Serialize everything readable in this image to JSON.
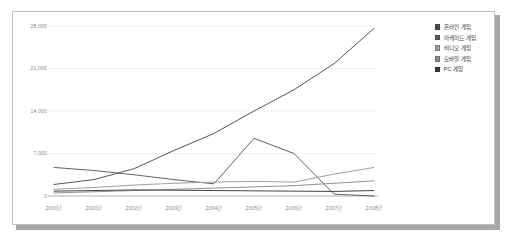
{
  "chart_data": {
    "type": "line",
    "title": "",
    "xlabel": "",
    "ylabel": "",
    "grid": true,
    "legend_position": "top-right",
    "categories": [
      "2000년",
      "2001년",
      "2002년",
      "2003년",
      "2004년",
      "2005년",
      "2006년",
      "2007년",
      "2008년"
    ],
    "ylim": [
      0,
      28000
    ],
    "yticks": [
      0,
      7000,
      14000,
      21000,
      28000
    ],
    "ytick_labels": [
      "0",
      "7,000",
      "14,000",
      "21,000",
      "28,000"
    ],
    "series": [
      {
        "name": "온라인 게임",
        "color": "#4d4d4d",
        "values": [
          1900,
          2700,
          4500,
          7500,
          10300,
          14000,
          17500,
          21800,
          27600
        ]
      },
      {
        "name": "아케이드 게임",
        "color": "#5a5a5a",
        "values": [
          4700,
          4200,
          3500,
          2700,
          2000,
          9500,
          7000,
          300,
          0
        ]
      },
      {
        "name": "비디오 게임",
        "color": "#9a9a9a",
        "values": [
          1100,
          1400,
          1800,
          2100,
          2300,
          2400,
          2300,
          3600,
          4700
        ]
      },
      {
        "name": "모바일 게임",
        "color": "#8c8c8c",
        "values": [
          500,
          700,
          900,
          1100,
          1300,
          1500,
          1700,
          2100,
          2500
        ]
      },
      {
        "name": "PC 게임",
        "color": "#3a3a3a",
        "values": [
          800,
          900,
          1000,
          950,
          900,
          850,
          800,
          750,
          900
        ]
      }
    ]
  },
  "legend": {
    "items": [
      {
        "label": "온라인 게임",
        "color": "#4d4d4d"
      },
      {
        "label": "아케이드 게임",
        "color": "#5a5a5a"
      },
      {
        "label": "비디오 게임",
        "color": "#9a9a9a"
      },
      {
        "label": "모바일 게임",
        "color": "#8c8c8c"
      },
      {
        "label": "PC 게임",
        "color": "#3a3a3a"
      }
    ]
  },
  "axes": {
    "y_tick_labels": [
      "28,000",
      "21,000",
      "14,000",
      "7,000",
      "0"
    ],
    "x_tick_labels": [
      "2000년",
      "2001년",
      "2002년",
      "2003년",
      "2004년",
      "2005년",
      "2006년",
      "2007년",
      "2008년"
    ]
  },
  "style": {
    "gridline_color": "#e6e6e6",
    "axis_text_color": "#8a8a8a",
    "card_border_color": "#bfbfbf",
    "shadow_color": "#a8a8a8",
    "background": "#ffffff"
  }
}
